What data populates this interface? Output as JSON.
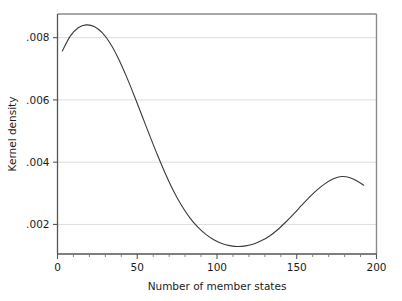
{
  "chart_data": {
    "type": "line",
    "title": "",
    "subtitle": "",
    "xlabel": "Number of member states",
    "ylabel": "Kernel density",
    "xlim": [
      0,
      200
    ],
    "ylim": [
      0.00105,
      0.00876
    ],
    "xticks": [
      0,
      50,
      100,
      150,
      200
    ],
    "xtick_labels": [
      "0",
      "50",
      "100",
      "150",
      "200"
    ],
    "yticks": [
      0.002,
      0.004,
      0.006,
      0.008
    ],
    "ytick_labels": [
      ".002",
      ".004",
      ".006",
      ".008"
    ],
    "grid": "horizontal",
    "legend": "none",
    "series": [
      {
        "name": "Kernel density",
        "color": "#3a3a3a",
        "line_width": 1.1,
        "x": [
          3,
          8,
          13,
          18,
          23,
          28,
          33,
          38,
          43,
          48,
          53,
          58,
          63,
          68,
          73,
          78,
          83,
          88,
          93,
          98,
          103,
          108,
          113,
          118,
          123,
          128,
          133,
          138,
          143,
          148,
          153,
          158,
          163,
          168,
          173,
          178,
          183,
          188,
          192
        ],
        "y": [
          0.00757,
          0.00805,
          0.00832,
          0.00841,
          0.00836,
          0.00816,
          0.00782,
          0.00735,
          0.00678,
          0.00615,
          0.00549,
          0.00483,
          0.00419,
          0.00359,
          0.00305,
          0.00259,
          0.00221,
          0.00191,
          0.00168,
          0.00151,
          0.00139,
          0.00132,
          0.00129,
          0.00131,
          0.00137,
          0.00148,
          0.00163,
          0.00183,
          0.00207,
          0.00233,
          0.00261,
          0.00288,
          0.00312,
          0.00332,
          0.00347,
          0.00354,
          0.00351,
          0.00339,
          0.00326
        ]
      }
    ],
    "annotations": {
      "first_peak_x": 18,
      "first_peak_y": 0.00841,
      "trough_x": 110,
      "trough_y": 0.00128,
      "second_peak_x": 179,
      "second_peak_y": 0.00354
    },
    "colors": {
      "line": "#3a3a3a",
      "frame": "#6b6b6b",
      "grid": "#dddddd",
      "background": "#ffffff",
      "text": "#1c1c1c"
    }
  }
}
